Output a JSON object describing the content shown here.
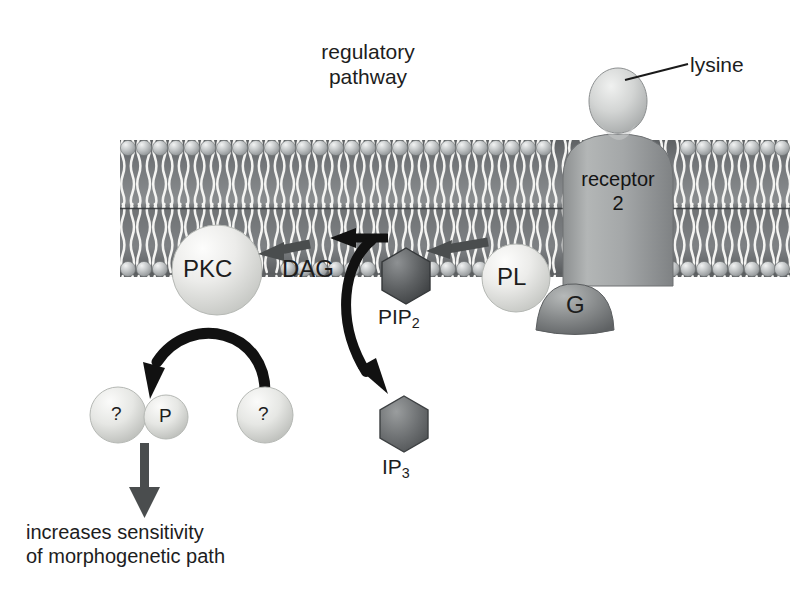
{
  "figure": {
    "type": "cell-signalling-pathway-diagram",
    "title": "regulatory pathway",
    "title_lines": [
      "regulatory",
      "pathway"
    ],
    "background_color": "#ffffff",
    "canvas": {
      "width": 809,
      "height": 607
    }
  },
  "membrane": {
    "name": "lipid-bilayer",
    "top_y": 140,
    "bottom_y": 277,
    "left_x": 120,
    "right_x": 790,
    "head_color": "#b9bcbe",
    "interior_color": "#636668",
    "tail_color": "#f2f2f0",
    "head_count_per_leaflet": 42
  },
  "labels": {
    "regulatory": "regulatory",
    "pathway": "pathway",
    "lysine": "lysine",
    "receptor_line1": "receptor",
    "receptor_line2": "2",
    "pkc": "PKC",
    "dag": "DAG",
    "pip2_base": "PIP",
    "pip2_sub": "2",
    "pl": "PL",
    "g": "G",
    "ip3_base": "IP",
    "ip3_sub": "3",
    "question_left": "?",
    "phospho": "P",
    "question_right": "?",
    "outcome_line1": "increases sensitivity",
    "outcome_line2": "of morphogenetic path"
  },
  "nodes": [
    {
      "id": "lysine",
      "label": "lysine",
      "shape": "teardrop",
      "cx": 618,
      "cy": 85,
      "fill": "#d6d8d8"
    },
    {
      "id": "receptor",
      "label": "receptor 2",
      "shape": "rounded-column",
      "cx": 618,
      "cy": 200,
      "fill": "#9b9e9f"
    },
    {
      "id": "pkc",
      "label": "PKC",
      "shape": "circle",
      "cx": 217,
      "cy": 270,
      "r": 45,
      "fill": "#e3e4e1"
    },
    {
      "id": "pip2",
      "label": "PIP2",
      "shape": "hexagon",
      "cx": 406,
      "cy": 276,
      "r": 28,
      "fill": "#5a5d5e"
    },
    {
      "id": "pl",
      "label": "PL",
      "shape": "circle",
      "cx": 516,
      "cy": 278,
      "r": 34,
      "fill": "#e2e3e0"
    },
    {
      "id": "g",
      "label": "G",
      "shape": "blob",
      "cx": 570,
      "cy": 305,
      "fill": "#7d8081"
    },
    {
      "id": "ip3",
      "label": "IP3",
      "shape": "hexagon",
      "cx": 404,
      "cy": 424,
      "r": 28,
      "fill": "#6b6e6f"
    },
    {
      "id": "target-q1",
      "label": "?",
      "shape": "circle",
      "cx": 118,
      "cy": 415,
      "r": 28,
      "fill": "#dcdedb"
    },
    {
      "id": "phospho",
      "label": "P",
      "shape": "circle",
      "cx": 166,
      "cy": 417,
      "r": 22,
      "fill": "#e0e1de"
    },
    {
      "id": "target-q2",
      "label": "?",
      "shape": "circle",
      "cx": 265,
      "cy": 415,
      "r": 28,
      "fill": "#dcdedb"
    }
  ],
  "arrows": [
    {
      "id": "pl-to-pip2",
      "from": "PL",
      "to": "PIP2",
      "style": "straight",
      "color": "#4a4d4e"
    },
    {
      "id": "pip2-to-dag",
      "from": "PIP2",
      "to": "DAG",
      "style": "straight",
      "color": "#111111"
    },
    {
      "id": "dag-to-pkc",
      "from": "DAG",
      "to": "PKC",
      "style": "straight",
      "color": "#4a4d4e"
    },
    {
      "id": "pip2-to-ip3",
      "from": "PIP2",
      "to": "IP3",
      "style": "curved",
      "color": "#111111"
    },
    {
      "id": "pkc-to-p",
      "from": "PKC",
      "to": "P",
      "style": "arc",
      "color": "#111111"
    },
    {
      "id": "p-to-outcome",
      "from": "P",
      "to": "increases sensitivity of morphogenetic path",
      "style": "straight-down",
      "color": "#4a4d4e"
    }
  ],
  "colors": {
    "ink": "#1a1a1a",
    "arrow_black": "#111111",
    "arrow_gray": "#4a4d4e",
    "membrane_dark": "#636668",
    "membrane_head": "#b9bcbe",
    "receptor": "#9b9e9f",
    "protein_light": "#e3e4e1",
    "protein_dark": "#5a5d5e"
  }
}
